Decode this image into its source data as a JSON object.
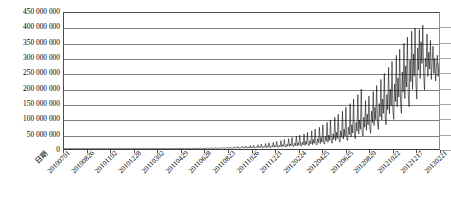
{
  "chart_data": {
    "type": "line",
    "title": "",
    "xlabel": "日期",
    "ylabel": "",
    "ylim": [
      0,
      450000000
    ],
    "ytick_values": [
      0,
      50000000,
      100000000,
      150000000,
      200000000,
      250000000,
      300000000,
      350000000,
      400000000,
      450000000
    ],
    "ytick_labels": [
      "450 000 000",
      "400 000 000",
      "350 000 000",
      "300 000 000",
      "250 000 000",
      "200 000 000",
      "150 000 000",
      "100 000 000",
      "50 000 000",
      "0"
    ],
    "grid": true,
    "grid_axis": "y",
    "legend": false,
    "legend_position": "none",
    "line_color": "#000000",
    "grid_color": "#808080",
    "background_color": "#ffffff",
    "xtick_labels": [
      "20100701",
      "20100826",
      "20101102",
      "20101228",
      "20110302",
      "20110429",
      "20110628",
      "20110823",
      "20111026",
      "20111221",
      "20120224",
      "20120425",
      "20120625",
      "20120820",
      "20121022",
      "20121217",
      "20130221"
    ],
    "x_range": [
      "20100701",
      "20130221"
    ],
    "series": [
      {
        "name": "",
        "color": "#000000",
        "values": [
          1200000,
          900000,
          1500000,
          1100000,
          800000,
          1400000,
          1000000,
          1300000,
          900000,
          1600000,
          1100000,
          800000,
          1200000,
          1500000,
          1000000,
          900000,
          1400000,
          1100000,
          1700000,
          1200000,
          900000,
          1300000,
          1000000,
          1500000,
          1100000,
          800000,
          1200000,
          1600000,
          1000000,
          1300000,
          900000,
          1400000,
          1100000,
          1800000,
          1200000,
          900000,
          1500000,
          1100000,
          1000000,
          1300000,
          1600000,
          1200000,
          900000,
          1400000,
          1100000,
          1700000,
          1000000,
          1300000,
          1200000,
          900000,
          1500000,
          1100000,
          1800000,
          1200000,
          1000000,
          1400000,
          1300000,
          900000,
          1600000,
          1100000,
          1200000,
          1500000,
          1000000,
          1300000,
          1100000,
          1900000,
          1200000,
          900000,
          1400000,
          1600000,
          1100000,
          1300000,
          1000000,
          1500000,
          1200000,
          2000000,
          1100000,
          1300000,
          900000,
          1700000,
          1400000,
          1100000,
          1200000,
          1600000,
          1000000,
          1300000,
          1500000,
          1100000,
          2100000,
          1200000,
          1400000,
          1000000,
          1800000,
          1300000,
          1100000,
          1500000,
          1200000,
          1600000,
          1000000,
          1400000,
          1300000,
          2200000,
          1100000,
          1500000,
          1200000,
          1700000,
          1300000,
          1000000,
          1600000,
          1400000,
          1200000,
          1900000,
          1300000,
          1100000,
          1500000,
          1700000,
          1200000,
          1400000,
          2300000,
          1300000,
          1600000,
          1100000,
          1500000,
          1800000,
          1200000,
          1400000,
          1300000,
          2000000,
          1600000,
          1200000,
          1500000,
          1700000,
          1300000,
          2400000,
          1400000,
          1200000,
          1900000,
          1500000,
          1300000,
          1600000,
          2100000,
          1400000,
          1200000,
          1800000,
          2600000,
          1500000,
          1300000,
          2000000,
          1600000,
          1400000,
          2300000,
          1700000,
          1500000,
          2800000,
          1600000,
          1400000,
          2100000,
          1800000,
          1500000,
          2500000,
          3000000,
          1700000,
          1500000,
          2200000,
          1900000,
          1600000,
          2700000,
          2000000,
          3400000,
          1800000,
          1600000,
          2400000,
          2100000,
          3800000,
          1900000,
          2600000,
          2200000,
          4200000,
          2000000,
          1800000,
          2900000,
          2300000,
          4600000,
          2100000,
          3200000,
          2400000,
          5200000,
          2200000,
          2000000,
          3500000,
          2600000,
          5800000,
          2300000,
          3800000,
          2700000,
          6400000,
          2500000,
          2200000,
          4200000,
          2900000,
          7200000,
          2600000,
          4600000,
          3100000,
          8000000,
          2800000,
          2400000,
          5000000,
          3400000,
          9000000,
          3000000,
          5500000,
          3600000,
          10000000,
          3200000,
          2800000,
          6000000,
          3900000,
          11000000,
          3400000,
          6600000,
          4200000,
          12500000,
          3700000,
          3200000,
          7200000,
          4600000,
          14000000,
          4000000,
          8000000,
          5000000,
          16000000,
          4400000,
          3800000,
          8800000,
          5500000,
          18000000,
          4800000,
          9600000,
          6000000,
          20000000,
          5200000,
          4600000,
          10500000,
          6600000,
          22000000,
          5800000,
          11500000,
          7200000,
          25000000,
          6400000,
          5400000,
          12500000,
          8000000,
          28000000,
          7000000,
          14000000,
          8800000,
          31000000,
          7600000,
          6400000,
          15500000,
          9600000,
          34000000,
          8400000,
          17000000,
          10500000,
          38000000,
          9200000,
          7600000,
          19000000,
          11500000,
          42000000,
          10000000,
          21000000,
          12500000,
          46000000,
          11000000,
          9000000,
          23000000,
          14000000,
          50000000,
          12000000,
          25000000,
          15500000,
          55000000,
          13000000,
          11000000,
          28000000,
          17000000,
          60000000,
          14500000,
          31000000,
          19000000,
          66000000,
          16000000,
          13000000,
          34000000,
          21000000,
          72000000,
          18000000,
          38000000,
          23000000,
          80000000,
          20000000,
          16000000,
          42000000,
          26000000,
          88000000,
          22000000,
          46000000,
          29000000,
          96000000,
          24000000,
          19000000,
          50000000,
          32000000,
          105000000,
          27000000,
          55000000,
          35000000,
          115000000,
          30000000,
          23000000,
          60000000,
          39000000,
          125000000,
          33000000,
          66000000,
          43000000,
          138000000,
          36000000,
          28000000,
          72000000,
          48000000,
          150000000,
          40000000,
          80000000,
          53000000,
          165000000,
          45000000,
          34000000,
          88000000,
          59000000,
          180000000,
          50000000,
          96000000,
          65000000,
          198000000,
          56000000,
          42000000,
          105000000,
          72000000,
          160000000,
          62000000,
          115000000,
          80000000,
          175000000,
          70000000,
          52000000,
          125000000,
          88000000,
          190000000,
          78000000,
          138000000,
          97000000,
          210000000,
          87000000,
          65000000,
          150000000,
          107000000,
          230000000,
          96000000,
          165000000,
          118000000,
          250000000,
          106000000,
          80000000,
          180000000,
          130000000,
          270000000,
          117000000,
          198000000,
          143000000,
          290000000,
          128000000,
          98000000,
          215000000,
          157000000,
          310000000,
          140000000,
          235000000,
          172000000,
          330000000,
          153000000,
          118000000,
          255000000,
          188000000,
          350000000,
          167000000,
          275000000,
          205000000,
          370000000,
          182000000,
          140000000,
          295000000,
          223000000,
          390000000,
          198000000,
          315000000,
          242000000,
          400000000,
          215000000,
          165000000,
          335000000,
          262000000,
          395000000,
          233000000,
          355000000,
          283000000,
          410000000,
          252000000,
          195000000,
          300000000,
          272000000,
          380000000,
          240000000,
          320000000,
          265000000,
          360000000,
          230000000,
          285000000,
          340000000,
          250000000,
          300000000,
          225000000,
          270000000,
          310000000,
          240000000,
          285000000
        ]
      }
    ]
  }
}
